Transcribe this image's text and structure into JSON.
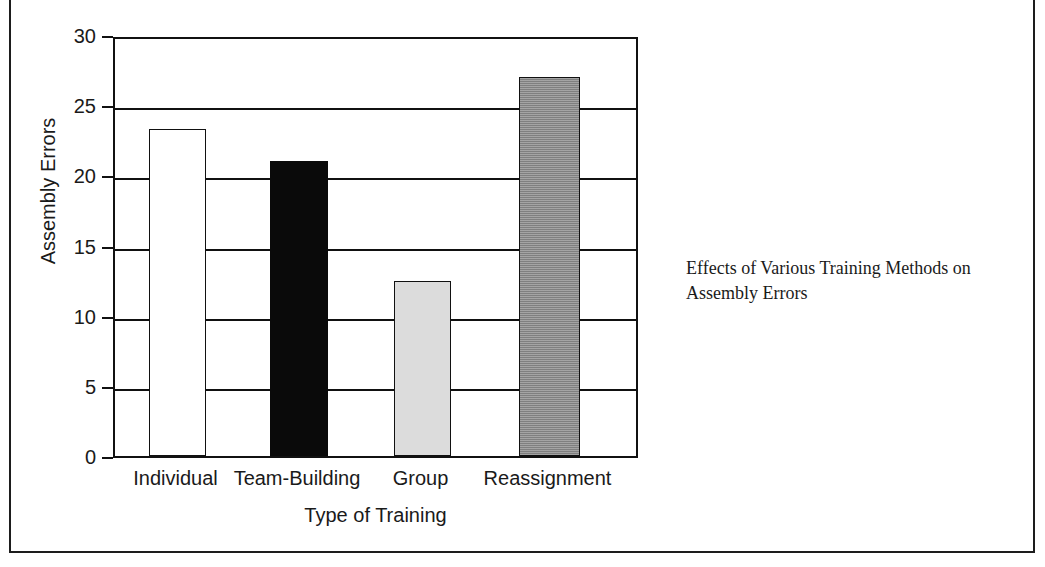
{
  "figure": {
    "caption": "Effects of Various Training Methods on Assembly Errors"
  },
  "chart_data": {
    "type": "bar",
    "title": "",
    "categories": [
      "Individual",
      "Team-Building",
      "Group",
      "Reassignment"
    ],
    "values": [
      23.3,
      21.0,
      12.5,
      27.0
    ],
    "series": [
      {
        "name": "Assembly Errors",
        "values": [
          23.3,
          21.0,
          12.5,
          27.0
        ]
      }
    ],
    "bar_styles": [
      "white",
      "black",
      "light-gray",
      "dark-gray"
    ],
    "bar_colors": [
      "#ffffff",
      "#0a0a0a",
      "#dcdcdc",
      "#8a8a8a"
    ],
    "xlabel": "Type of Training",
    "ylabel": "Assembly Errors",
    "ylim": [
      0,
      30
    ],
    "ytick_values": [
      30,
      25,
      20,
      15,
      10,
      5,
      0
    ],
    "ytick_labels": [
      "30",
      "25",
      "20",
      "15",
      "10",
      "5",
      "0"
    ],
    "ytick_step": 5,
    "grid": "horizontal",
    "legend": "none",
    "axis_color": "#111111",
    "background": "#ffffff"
  }
}
